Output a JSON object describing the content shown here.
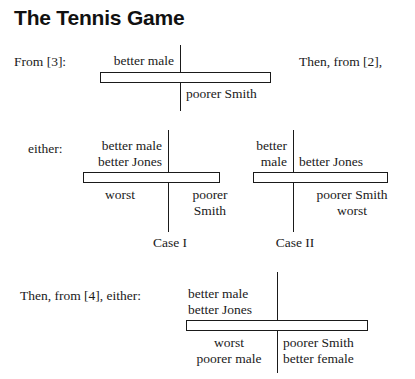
{
  "figure": {
    "title": "The Tennis Game",
    "diagrams": [
      {
        "id": "diagram-from-3",
        "lead_label": "From [3]:",
        "side_note": "Then, from [2],",
        "above_left": [
          "better male"
        ],
        "above_right": [],
        "below_left": [],
        "below_right": [
          "poorer Smith"
        ],
        "caption": ""
      },
      {
        "id": "diagram-case-1",
        "lead_label": "either:",
        "side_note": "",
        "above_left": [
          "better male",
          "better Jones"
        ],
        "above_right": [],
        "below_left": [
          "worst"
        ],
        "below_right": [
          "poorer",
          "Smith"
        ],
        "caption": "Case I"
      },
      {
        "id": "diagram-case-2",
        "lead_label": "",
        "side_note": "",
        "above_left": [
          "better",
          "male"
        ],
        "above_right": [
          "better Jones"
        ],
        "below_left": [],
        "below_right": [
          "poorer Smith",
          "worst"
        ],
        "caption": "Case II"
      },
      {
        "id": "diagram-from-4",
        "lead_label": "Then, from [4], either:",
        "side_note": "",
        "above_left": [
          "better male",
          "better Jones"
        ],
        "above_right": [],
        "below_left": [
          "worst",
          "poorer male"
        ],
        "below_right": [
          "poorer Smith",
          "better female"
        ],
        "caption": ""
      }
    ],
    "colors": {
      "ink": "#1a1a1a",
      "paper": "#ffffff"
    }
  }
}
